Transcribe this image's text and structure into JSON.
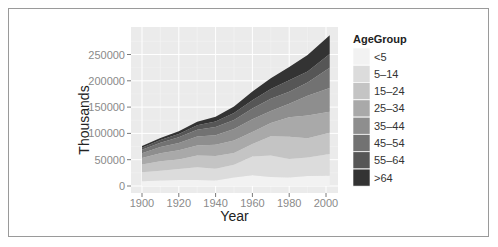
{
  "chart_data": {
    "type": "area",
    "stacked": true,
    "title": "",
    "xlabel": "Year",
    "ylabel": "Thousands",
    "xlim": [
      1900,
      2002
    ],
    "ylim": [
      0,
      290000
    ],
    "x_ticks": [
      1900,
      1920,
      1940,
      1960,
      1980,
      2000
    ],
    "y_ticks": [
      0,
      50000,
      100000,
      150000,
      200000,
      250000
    ],
    "y_tick_labels": [
      "0",
      "50000",
      "100000",
      "150000",
      "200000",
      "250000"
    ],
    "x_tick_labels": [
      "1900",
      "1920",
      "1940",
      "1960",
      "1980",
      "2000"
    ],
    "grid": true,
    "legend_title": "AgeGroup",
    "legend_position": "right",
    "x": [
      1900,
      1910,
      1920,
      1930,
      1940,
      1950,
      1960,
      1970,
      1980,
      1990,
      2002
    ],
    "series": [
      {
        "name": "<5",
        "color": "#f2f2f2",
        "values": [
          9200,
          10600,
          11600,
          11400,
          10500,
          16200,
          20300,
          17200,
          16300,
          18800,
          19600
        ]
      },
      {
        "name": "5-14",
        "color": "#dcdcdc",
        "values": [
          16900,
          18400,
          20900,
          24100,
          22400,
          24300,
          35500,
          40700,
          34900,
          35100,
          41100
        ]
      },
      {
        "name": "15-24",
        "color": "#c4c4c4",
        "values": [
          14900,
          18200,
          18100,
          22500,
          24000,
          22200,
          24000,
          36500,
          42500,
          37000,
          40500
        ]
      },
      {
        "name": "25-34",
        "color": "#a9a9a9",
        "values": [
          12200,
          15000,
          17200,
          18900,
          21400,
          23900,
          22900,
          25300,
          37100,
          43200,
          39900
        ]
      },
      {
        "name": "35-44",
        "color": "#8e8e8e",
        "values": [
          9200,
          11800,
          14200,
          17200,
          18300,
          21500,
          24200,
          23100,
          25600,
          37400,
          45100
        ]
      },
      {
        "name": "45-54",
        "color": "#727272",
        "values": [
          6400,
          8400,
          10500,
          13000,
          15500,
          17400,
          20600,
          23200,
          22800,
          25100,
          38700
        ]
      },
      {
        "name": "55-64",
        "color": "#565656",
        "values": [
          4000,
          5100,
          6500,
          8400,
          10600,
          13300,
          15600,
          18600,
          21700,
          21100,
          26100
        ]
      },
      {
        "name": ">64",
        "color": "#333333",
        "values": [
          3100,
          3900,
          4900,
          6600,
          9000,
          12300,
          16600,
          20100,
          25500,
          31200,
          35600
        ]
      }
    ]
  },
  "legend": {
    "title": "AgeGroup",
    "items": [
      {
        "label": "<5",
        "color": "#f2f2f2"
      },
      {
        "label": "5–14",
        "color": "#dcdcdc"
      },
      {
        "label": "15–24",
        "color": "#c4c4c4"
      },
      {
        "label": "25–34",
        "color": "#a9a9a9"
      },
      {
        "label": "35–44",
        "color": "#8e8e8e"
      },
      {
        "label": "45–54",
        "color": "#727272"
      },
      {
        "label": "55–64",
        "color": "#565656"
      },
      {
        "label": ">64",
        "color": "#333333"
      }
    ]
  },
  "axes": {
    "x_title": "Year",
    "y_title": "Thousands"
  },
  "colors": {
    "panel_bg": "#ebebeb",
    "grid_major": "#ffffff",
    "frame": "#9a9a9a"
  }
}
